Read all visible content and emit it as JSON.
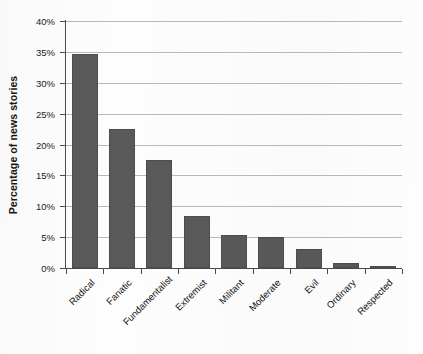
{
  "chart_data": {
    "type": "bar",
    "title": "",
    "xlabel": "",
    "ylabel": "Percentage of news stories",
    "categories": [
      "Radical",
      "Fanatic",
      "Fundamentalist",
      "Extremist",
      "Militant",
      "Moderate",
      "Evil",
      "Ordinary",
      "Respected"
    ],
    "values": [
      34.7,
      22.5,
      17.5,
      8.5,
      5.3,
      5.0,
      3.0,
      0.8,
      0.2
    ],
    "value_labels": [
      "34.7%",
      "22.5%",
      "17.5%",
      "8.5%",
      "5.3%",
      "5.0%",
      "3.0%",
      "0.8%",
      "0.2%"
    ],
    "ylim": [
      0,
      40
    ],
    "ytick_values": [
      0,
      5,
      10,
      15,
      20,
      25,
      30,
      35,
      40
    ],
    "ytick_labels": [
      "0%",
      "5%",
      "10%",
      "15%",
      "20%",
      "25%",
      "30%",
      "35%",
      "40%"
    ],
    "grid": "horizontal",
    "legend": "none",
    "series_color": "#595959",
    "gridline_color": "#b9b9b9",
    "axis_color": "#4a4a4a",
    "background_color": "#fdfdfd",
    "label_rotation": "-45"
  }
}
